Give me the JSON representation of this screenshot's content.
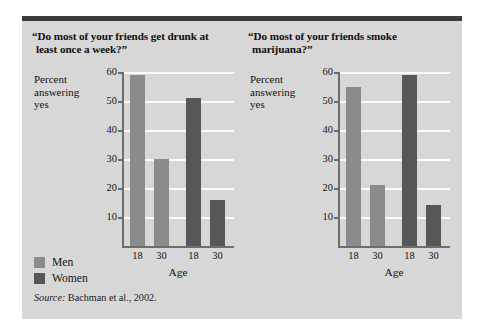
{
  "figure": {
    "legend": {
      "items": [
        {
          "label": "Men",
          "color": "#8b8b8b",
          "key": "men"
        },
        {
          "label": "Women",
          "color": "#575757",
          "key": "women"
        }
      ]
    },
    "source": {
      "prefix": "Source:",
      "text": " Bachman et al., 2002."
    },
    "colors": {
      "panel_background": "#d7d7d7",
      "rule": "#3b3b3b",
      "gridline": "#fbfbfb",
      "axis": "#6e6e6e",
      "men": "#8b8b8b",
      "women": "#575757"
    }
  },
  "chart_data": [
    {
      "type": "bar",
      "id": "drunk",
      "title": "“Do most of your friends get drunk at",
      "title_line2": "least once a week?”",
      "ylabel": "Percent answering yes",
      "ylabel_lines": [
        "Percent",
        "answering",
        "yes"
      ],
      "xlabel": "Age",
      "categories": [
        "18",
        "30",
        "18",
        "30"
      ],
      "ylim": [
        0,
        60
      ],
      "yticks": [
        60,
        50,
        40,
        30,
        20,
        10
      ],
      "grid": true,
      "legend_position": "lower-left-outside",
      "series": [
        {
          "name": "Men",
          "color": "#8b8b8b",
          "categories": [
            "18",
            "30"
          ],
          "values": [
            59,
            30
          ]
        },
        {
          "name": "Women",
          "color": "#575757",
          "categories": [
            "18",
            "30"
          ],
          "values": [
            51,
            16
          ]
        }
      ],
      "bars": [
        {
          "group": "Men",
          "age": "18",
          "value": 59
        },
        {
          "group": "Men",
          "age": "30",
          "value": 30
        },
        {
          "group": "Women",
          "age": "18",
          "value": 51
        },
        {
          "group": "Women",
          "age": "30",
          "value": 16
        }
      ]
    },
    {
      "type": "bar",
      "id": "marijuana",
      "title": "“Do most of your friends smoke",
      "title_line2": "marijuana?”",
      "ylabel": "Percent answering yes",
      "ylabel_lines": [
        "Percent",
        "answering",
        "yes"
      ],
      "xlabel": "Age",
      "categories": [
        "18",
        "30",
        "18",
        "30"
      ],
      "ylim": [
        0,
        60
      ],
      "yticks": [
        60,
        50,
        40,
        30,
        20,
        10
      ],
      "grid": true,
      "legend_position": "lower-left-outside",
      "series": [
        {
          "name": "Men",
          "color": "#8b8b8b",
          "categories": [
            "18",
            "30"
          ],
          "values": [
            55,
            21
          ]
        },
        {
          "name": "Women",
          "color": "#575757",
          "categories": [
            "18",
            "30"
          ],
          "values": [
            59,
            14
          ]
        }
      ],
      "bars": [
        {
          "group": "Men",
          "age": "18",
          "value": 55
        },
        {
          "group": "Men",
          "age": "30",
          "value": 21
        },
        {
          "group": "Women",
          "age": "18",
          "value": 59
        },
        {
          "group": "Women",
          "age": "30",
          "value": 14
        }
      ]
    }
  ]
}
